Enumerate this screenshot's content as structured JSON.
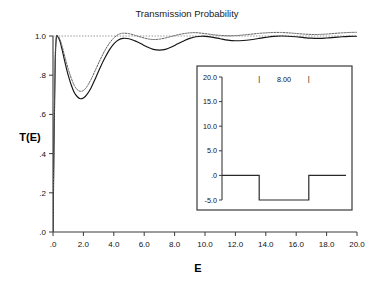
{
  "figure": {
    "title": "Transmission Probability",
    "background": "#ffffff"
  },
  "chart_data": {
    "type": "line",
    "title": "Transmission Probability",
    "xlabel": "E",
    "ylabel": "T(E)",
    "xlim": [
      0.0,
      20.0
    ],
    "ylim": [
      0.0,
      1.0
    ],
    "grid": false,
    "legend": "none",
    "xticks": [
      0.0,
      2.0,
      4.0,
      6.0,
      8.0,
      10.0,
      12.0,
      14.0,
      16.0,
      18.0,
      20.0
    ],
    "xticklabels": [
      ".0",
      "2.0",
      "4.0",
      "6.0",
      "8.0",
      "10.0",
      "12.0",
      "14.0",
      "16.0",
      "18.0",
      "20.0"
    ],
    "yticks": [
      0.0,
      0.2,
      0.4,
      0.6,
      0.8,
      1.0
    ],
    "yticklabels": [
      ".0",
      ".2",
      ".4",
      ".6",
      ".8",
      "1.0"
    ],
    "annotations": [
      {
        "name": "unitary-reference",
        "type": "hline",
        "y": 1.0,
        "style": "dotted",
        "color": "#8a8a8a"
      }
    ],
    "series": [
      {
        "name": "exact-transmission",
        "style": "solid",
        "color": "#141414",
        "x": [
          0.0,
          0.08,
          0.15,
          0.22,
          0.3,
          0.45,
          0.6,
          0.8,
          1.0,
          1.2,
          1.4,
          1.6,
          1.8,
          2.0,
          2.2,
          2.5,
          2.8,
          3.1,
          3.4,
          3.7,
          4.0,
          4.3,
          4.6,
          5.0,
          5.4,
          5.8,
          6.2,
          6.6,
          7.0,
          7.4,
          7.8,
          8.2,
          8.6,
          9.0,
          9.4,
          9.8,
          10.2,
          10.6,
          11.0,
          11.5,
          12.0,
          12.5,
          13.0,
          13.5,
          14.0,
          14.5,
          15.0,
          15.5,
          16.0,
          16.5,
          17.0,
          17.5,
          18.0,
          18.5,
          19.0,
          19.5,
          20.0
        ],
        "y": [
          0.0,
          0.54,
          0.88,
          0.99,
          0.998,
          0.975,
          0.93,
          0.862,
          0.8,
          0.75,
          0.712,
          0.69,
          0.68,
          0.684,
          0.698,
          0.735,
          0.785,
          0.838,
          0.886,
          0.928,
          0.96,
          0.98,
          0.988,
          0.986,
          0.975,
          0.96,
          0.944,
          0.932,
          0.928,
          0.932,
          0.944,
          0.96,
          0.975,
          0.988,
          0.996,
          0.999,
          0.997,
          0.992,
          0.986,
          0.979,
          0.976,
          0.977,
          0.981,
          0.987,
          0.993,
          0.998,
          1.0,
          0.999,
          0.996,
          0.992,
          0.989,
          0.988,
          0.99,
          0.993,
          0.996,
          0.998,
          0.999
        ]
      },
      {
        "name": "approximate-transmission",
        "style": "dotted",
        "color": "#5e5e5e",
        "x": [
          0.0,
          0.08,
          0.15,
          0.22,
          0.3,
          0.45,
          0.6,
          0.8,
          1.0,
          1.2,
          1.4,
          1.6,
          1.8,
          2.0,
          2.2,
          2.5,
          2.8,
          3.1,
          3.4,
          3.7,
          4.0,
          4.3,
          4.6,
          5.0,
          5.4,
          5.8,
          6.2,
          6.6,
          7.0,
          7.4,
          7.8,
          8.2,
          8.6,
          9.0,
          9.4,
          9.8,
          10.2,
          10.6,
          11.0,
          11.5,
          12.0,
          12.5,
          13.0,
          13.5,
          14.0,
          14.5,
          15.0,
          15.5,
          16.0,
          16.5,
          17.0,
          17.5,
          18.0,
          18.5,
          19.0,
          19.5,
          20.0
        ],
        "y": [
          0.0,
          0.56,
          0.9,
          0.995,
          1.0,
          0.984,
          0.948,
          0.888,
          0.832,
          0.785,
          0.748,
          0.726,
          0.718,
          0.722,
          0.738,
          0.778,
          0.828,
          0.878,
          0.924,
          0.962,
          0.99,
          1.008,
          1.014,
          1.012,
          1.003,
          0.994,
          0.986,
          0.982,
          0.984,
          0.99,
          0.998,
          1.006,
          1.012,
          1.016,
          1.017,
          1.014,
          1.01,
          1.006,
          1.003,
          1.001,
          1.002,
          1.005,
          1.009,
          1.013,
          1.016,
          1.018,
          1.018,
          1.016,
          1.013,
          1.01,
          1.008,
          1.008,
          1.01,
          1.013,
          1.016,
          1.018,
          1.019
        ]
      }
    ],
    "inset": {
      "name": "potential-well-inset",
      "type": "line",
      "xlim": [
        0.0,
        20.0
      ],
      "ylim": [
        -5.0,
        20.0
      ],
      "yticks": [
        -5.0,
        0.0,
        5.0,
        10.0,
        15.0,
        20.0
      ],
      "yticklabels": [
        "-5.0",
        ".0",
        "5.0",
        "10.0",
        "15.0",
        "20.0"
      ],
      "annotation_label": "8.00",
      "wall_marker": "|",
      "well_depth": -5.0,
      "well_left": 6.0,
      "well_right": 14.0,
      "baseline": 0.0,
      "x": [
        0.0,
        6.0,
        6.0,
        14.0,
        14.0,
        20.0
      ],
      "y": [
        0.0,
        0.0,
        -5.0,
        -5.0,
        0.0,
        0.0
      ]
    }
  }
}
